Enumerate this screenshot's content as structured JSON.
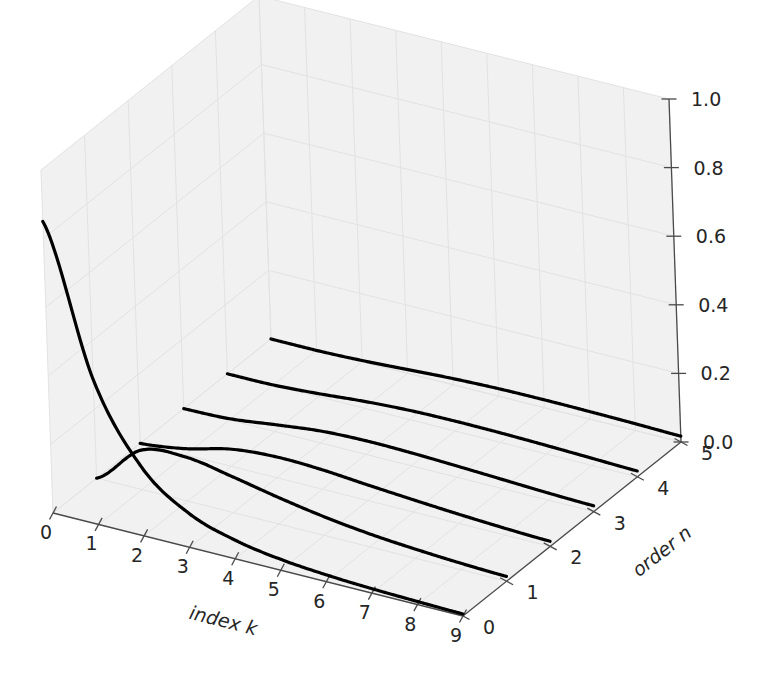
{
  "figure": {
    "background": "#ffffff",
    "pane_color": "#f1f1f1",
    "line_color": "#000000",
    "projection": "3d"
  },
  "chart_data": {
    "type": "line",
    "title": "",
    "subtitle": "",
    "xlabel": "index k",
    "ylabel": "order n",
    "zlabel": "",
    "xlim": [
      0,
      9
    ],
    "ylim": [
      0,
      5
    ],
    "zlim": [
      0.0,
      1.0
    ],
    "xticks": [
      "0",
      "1",
      "2",
      "3",
      "4",
      "5",
      "6",
      "7",
      "8",
      "9"
    ],
    "yticks": [
      "0",
      "1",
      "2",
      "3",
      "4",
      "5"
    ],
    "zticks": [
      "0.0",
      "0.2",
      "0.4",
      "0.6",
      "0.8",
      "1.0"
    ],
    "grid": true,
    "legend": "none",
    "x": [
      0,
      1,
      2,
      3,
      4,
      5,
      6,
      7,
      8,
      9
    ],
    "series": [
      {
        "name": "n = 0",
        "order": 0,
        "values": [
          0.85,
          0.42,
          0.2,
          0.1,
          0.055,
          0.032,
          0.02,
          0.013,
          0.009,
          0.006
        ]
      },
      {
        "name": "n = 1",
        "order": 1,
        "values": [
          0.0,
          0.115,
          0.128,
          0.105,
          0.078,
          0.055,
          0.038,
          0.027,
          0.019,
          0.014
        ]
      },
      {
        "name": "n = 2",
        "order": 2,
        "values": [
          0.0,
          0.018,
          0.05,
          0.061,
          0.057,
          0.046,
          0.036,
          0.027,
          0.02,
          0.015
        ]
      },
      {
        "name": "n = 3",
        "order": 3,
        "values": [
          0.0,
          0.004,
          0.02,
          0.035,
          0.04,
          0.038,
          0.033,
          0.027,
          0.021,
          0.017
        ]
      },
      {
        "name": "n = 4",
        "order": 4,
        "values": [
          0.0,
          0.001,
          0.009,
          0.02,
          0.027,
          0.029,
          0.028,
          0.025,
          0.021,
          0.017
        ]
      },
      {
        "name": "n = 5",
        "order": 5,
        "values": [
          0.0,
          0.0,
          0.004,
          0.011,
          0.018,
          0.022,
          0.023,
          0.022,
          0.02,
          0.017
        ]
      }
    ]
  },
  "axes": {
    "x_title": "index k",
    "y_title": "order n",
    "x_tick_labels": [
      "0",
      "1",
      "2",
      "3",
      "4",
      "5",
      "6",
      "7",
      "8",
      "9"
    ],
    "y_tick_labels": [
      "0",
      "1",
      "2",
      "3",
      "4",
      "5"
    ],
    "z_tick_labels": [
      "0.0",
      "0.2",
      "0.4",
      "0.6",
      "0.8",
      "1.0"
    ]
  }
}
